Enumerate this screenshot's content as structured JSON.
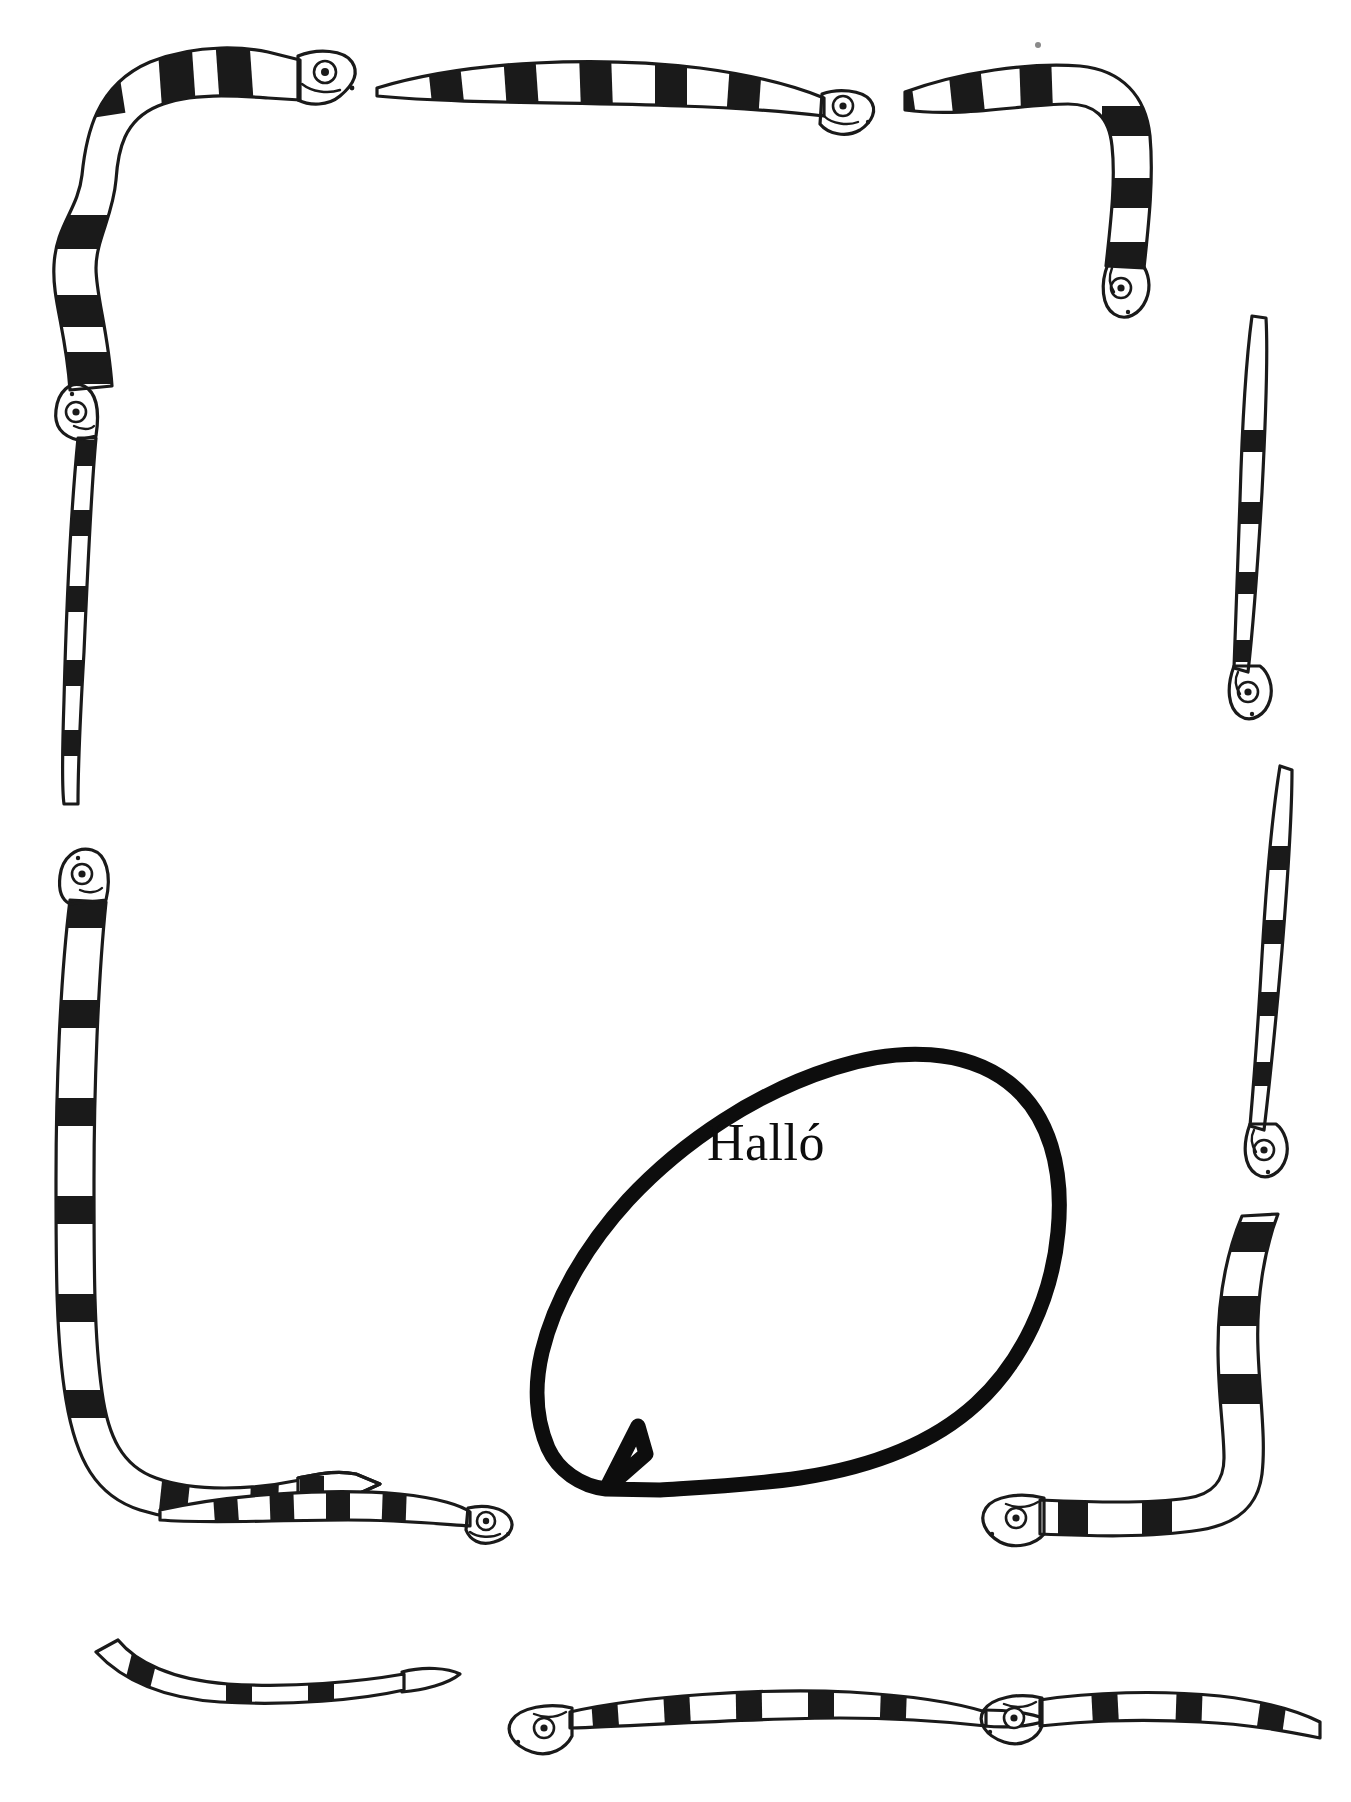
{
  "page": {
    "type": "worksheet-border-page",
    "background_color": "#ffffff",
    "ink_color": "#1a1a1a",
    "width": 1351,
    "height": 1802
  },
  "speech_bubble": {
    "text": "Halló",
    "outline_color": "#0d0d0d",
    "fill_color": "#ffffff",
    "stroke_width": 15,
    "tail_direction": "left-down"
  },
  "border": {
    "motif": "banded-sea-snake",
    "band_color": "#1a1a1a",
    "body_color": "#ffffff",
    "snakes": [
      {
        "id": "top-left-corner",
        "label": "banded snake, head right along top edge, body turning down left edge"
      },
      {
        "id": "top-middle",
        "label": "banded snake, head right, tapered tail to the left along top edge"
      },
      {
        "id": "top-right-corner",
        "label": "banded snake, body along top edge turning down right edge, head pointing down"
      },
      {
        "id": "left-upper",
        "label": "vertical banded snake on left edge, head up, tail down"
      },
      {
        "id": "left-lower",
        "label": "vertical banded snake on left edge, head up, body turning right along bottom edge"
      },
      {
        "id": "right-upper",
        "label": "vertical banded snake on right edge, head down"
      },
      {
        "id": "right-middle",
        "label": "vertical banded snake on right edge, head down"
      },
      {
        "id": "right-lower",
        "label": "vertical banded snake on right edge, head down"
      },
      {
        "id": "bottom-middle-tail",
        "label": "horizontal banded snake, head right, tapered tail to the left, points at bubble tail"
      },
      {
        "id": "bottom-center",
        "label": "horizontal banded snake on bottom edge, head left, tail right"
      },
      {
        "id": "bottom-right-corner",
        "label": "banded snake, head left along bottom edge, body turning up right edge"
      }
    ]
  }
}
